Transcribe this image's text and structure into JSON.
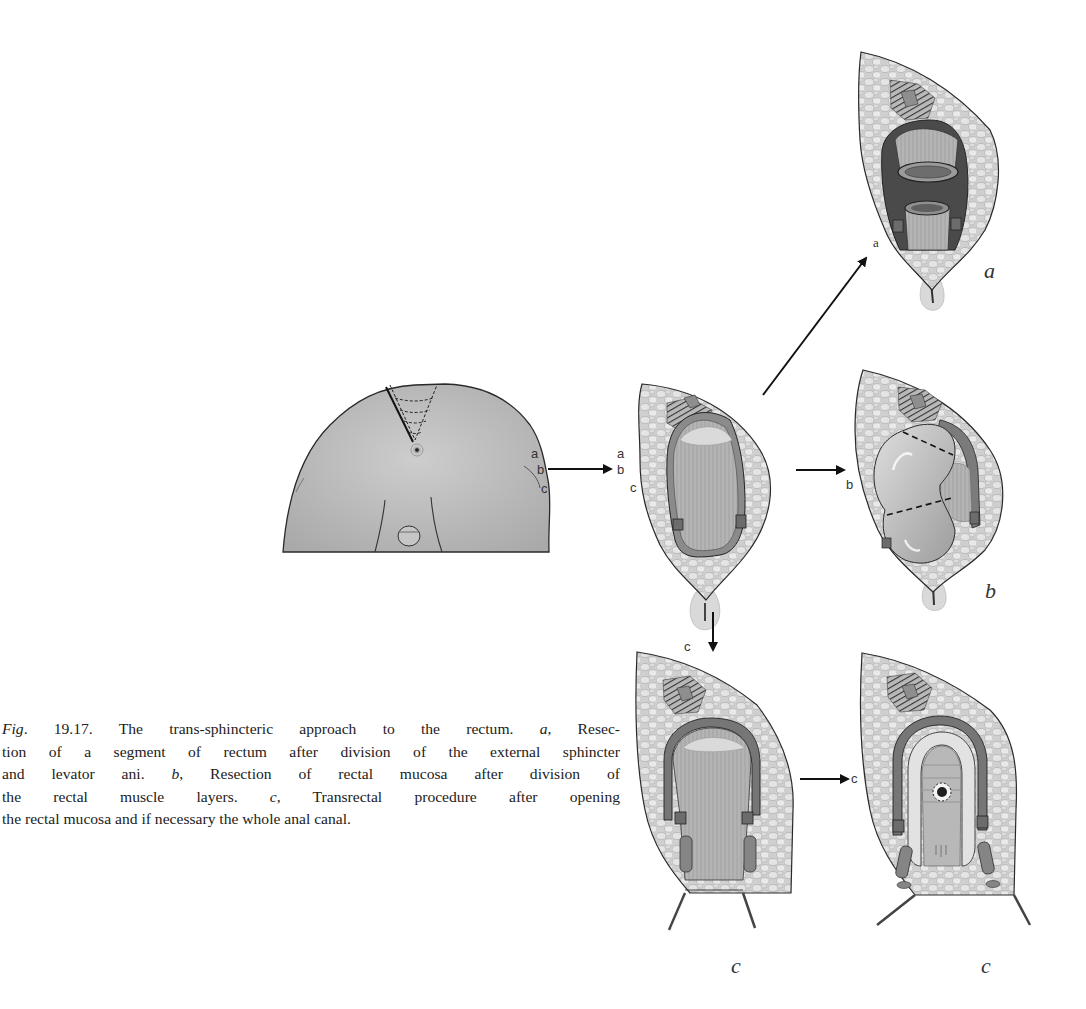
{
  "figure": {
    "number": "Fig. 19.17.",
    "number_prefix": "Fig.",
    "number_value": "19.17.",
    "caption_lines": [
      {
        "parts": [
          {
            "t": "Fig",
            "i": true
          },
          {
            "t": ". 19.17. The trans-sphincteric approach to the rectum. ",
            "i": false
          },
          {
            "t": "a",
            "i": true
          },
          {
            "t": ", Resec-",
            "i": false
          }
        ]
      },
      {
        "parts": [
          {
            "t": "tion of a segment of rectum after division of the external sphincter",
            "i": false
          }
        ]
      },
      {
        "parts": [
          {
            "t": "and levator ani. ",
            "i": false
          },
          {
            "t": "b",
            "i": true
          },
          {
            "t": ", Resection of rectal mucosa after division of",
            "i": false
          }
        ]
      },
      {
        "parts": [
          {
            "t": "the rectal muscle layers. ",
            "i": false
          },
          {
            "t": "c",
            "i": true
          },
          {
            "t": ", Transrectal procedure after opening",
            "i": false
          }
        ]
      },
      {
        "parts": [
          {
            "t": "the rectal mucosa and if necessary the whole anal canal.",
            "i": false
          }
        ]
      }
    ],
    "caption_full": "Fig. 19.17. The trans-sphincteric approach to the rectum. a, Resection of a segment of rectum after division of the external sphincter and levator ani. b, Resection of rectal mucosa after division of the rectal muscle layers. c, Transrectal procedure after opening the rectal mucosa and if necessary the whole anal canal."
  },
  "illustration": {
    "patient_view": {
      "side_labels": [
        "a",
        "b",
        "c"
      ]
    },
    "opened_wound": {
      "side_labels": [
        "a",
        "b",
        "c"
      ]
    },
    "arrows": [
      {
        "from": "patient_view",
        "to": "opened_wound",
        "label": ""
      },
      {
        "from": "opened_wound",
        "to": "panel_a",
        "label": "a"
      },
      {
        "from": "opened_wound",
        "to": "panel_b",
        "label": "b"
      },
      {
        "from": "opened_wound",
        "to": "panel_c1",
        "label": "c"
      },
      {
        "from": "panel_c1",
        "to": "panel_c2",
        "label": "c"
      }
    ],
    "panels": {
      "a": {
        "label": "a"
      },
      "b": {
        "label": "b"
      },
      "c1": {
        "label": "c"
      },
      "c2": {
        "label": "c"
      }
    }
  },
  "colors": {
    "skin": "#bdbdbd",
    "skin_dark": "#9a9a9a",
    "fat": "#d2d2d2",
    "fat_cell": "#e6e6e6",
    "muscle": "#7a7a7a",
    "outline": "#2a2a2a",
    "rectum": "#b0b0b0",
    "text": "#222222"
  }
}
